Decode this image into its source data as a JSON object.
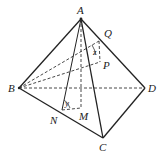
{
  "diagram": {
    "type": "tetrahedron",
    "points": {
      "A": {
        "label": "A",
        "x": 81,
        "y": 19
      },
      "B": {
        "label": "B",
        "x": 19,
        "y": 88
      },
      "C": {
        "label": "C",
        "x": 103,
        "y": 138
      },
      "D": {
        "label": "D",
        "x": 145,
        "y": 88
      },
      "Q": {
        "label": "Q",
        "x": 99,
        "y": 41
      },
      "P": {
        "label": "P",
        "x": 100,
        "y": 62
      },
      "N": {
        "label": "N",
        "x": 62,
        "y": 110
      },
      "M": {
        "label": "M",
        "x": 81,
        "y": 108
      }
    },
    "angle_labels": {
      "z": "z",
      "y": "y"
    },
    "solid_edges": [
      "AB",
      "AC",
      "AD",
      "BC",
      "CD",
      "AN"
    ],
    "dashed_edges": [
      "BD",
      "AM",
      "BQ",
      "BP",
      "NM",
      "QP"
    ]
  }
}
